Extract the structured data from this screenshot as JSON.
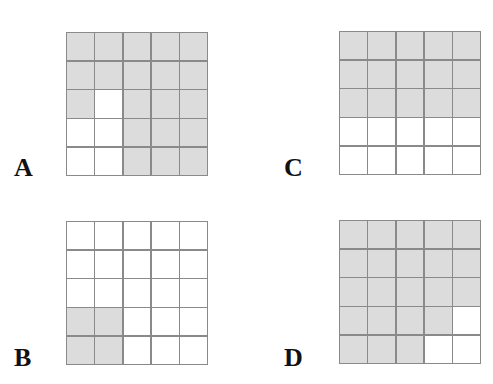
{
  "colors": {
    "filled": "#dcdcdc",
    "empty": "#ffffff",
    "line": "#8a8a8a"
  },
  "panels": [
    {
      "label": "A",
      "rows": [
        [
          1,
          1,
          1,
          1,
          1
        ],
        [
          1,
          1,
          1,
          1,
          1
        ],
        [
          1,
          0,
          1,
          1,
          1
        ],
        [
          0,
          0,
          1,
          1,
          1
        ],
        [
          0,
          0,
          1,
          1,
          1
        ]
      ]
    },
    {
      "label": "C",
      "rows": [
        [
          1,
          1,
          1,
          1,
          1
        ],
        [
          1,
          1,
          1,
          1,
          1
        ],
        [
          1,
          1,
          1,
          1,
          1
        ],
        [
          0,
          0,
          0,
          0,
          0
        ],
        [
          0,
          0,
          0,
          0,
          0
        ]
      ]
    },
    {
      "label": "B",
      "rows": [
        [
          0,
          0,
          0,
          0,
          0
        ],
        [
          0,
          0,
          0,
          0,
          0
        ],
        [
          0,
          0,
          0,
          0,
          0
        ],
        [
          1,
          1,
          0,
          0,
          0
        ],
        [
          1,
          1,
          0,
          0,
          0
        ]
      ]
    },
    {
      "label": "D",
      "rows": [
        [
          1,
          1,
          1,
          1,
          1
        ],
        [
          1,
          1,
          1,
          1,
          1
        ],
        [
          1,
          1,
          1,
          1,
          1
        ],
        [
          1,
          1,
          1,
          1,
          0
        ],
        [
          1,
          1,
          1,
          0,
          0
        ]
      ]
    }
  ]
}
